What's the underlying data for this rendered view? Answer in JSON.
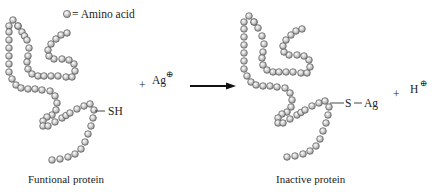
{
  "legend": {
    "symbol_label": "= Amino acid"
  },
  "reactants": {
    "protein_label": "Funtional protein",
    "thiol_group": "SH",
    "plus": "+",
    "ion": "Ag",
    "ion_charge": "⊕"
  },
  "arrow": {
    "direction": "right"
  },
  "products": {
    "protein_label": "Inactive protein",
    "bond_group_s": "S",
    "bond_group_ag": "Ag",
    "plus": "+",
    "ion": "H",
    "ion_charge": "⊕"
  },
  "colors": {
    "bead_fill": "#c8c8c8",
    "bead_stroke": "#555555",
    "text": "#222222",
    "arrow": "#111111"
  },
  "chains": {
    "left": [
      [
        18,
        26
      ],
      [
        13,
        20
      ],
      [
        9,
        26
      ],
      [
        9,
        32
      ],
      [
        9,
        40
      ],
      [
        9,
        48
      ],
      [
        9,
        56
      ],
      [
        9,
        64
      ],
      [
        9,
        72
      ],
      [
        12,
        79
      ],
      [
        16,
        85
      ],
      [
        21,
        88
      ],
      [
        28,
        89
      ],
      [
        35,
        89
      ],
      [
        42,
        90
      ],
      [
        50,
        91
      ],
      [
        55,
        96
      ],
      [
        57,
        103
      ],
      [
        56,
        110
      ],
      [
        52,
        115
      ],
      [
        47,
        117
      ],
      [
        43,
        121
      ],
      [
        43,
        126
      ],
      [
        48,
        126
      ],
      [
        55,
        122
      ],
      [
        62,
        118
      ],
      [
        70,
        113
      ],
      [
        77,
        109
      ],
      [
        84,
        106
      ],
      [
        90,
        104
      ],
      [
        94,
        110
      ],
      [
        93,
        118
      ],
      [
        91,
        126
      ],
      [
        88,
        134
      ],
      [
        85,
        142
      ],
      [
        81,
        149
      ],
      [
        75,
        154
      ],
      [
        68,
        157
      ],
      [
        60,
        159
      ],
      [
        52,
        160
      ]
    ],
    "left_inner": [
      [
        18,
        26
      ],
      [
        22,
        32
      ],
      [
        27,
        40
      ],
      [
        29,
        48
      ],
      [
        28,
        56
      ],
      [
        27,
        62
      ],
      [
        28,
        69
      ],
      [
        32,
        74
      ],
      [
        38,
        76
      ],
      [
        44,
        76
      ],
      [
        51,
        76
      ],
      [
        58,
        76
      ],
      [
        66,
        77
      ],
      [
        72,
        77
      ],
      [
        75,
        71
      ],
      [
        74,
        64
      ],
      [
        69,
        60
      ],
      [
        62,
        59
      ],
      [
        54,
        59
      ],
      [
        49,
        56
      ],
      [
        48,
        50
      ],
      [
        51,
        44
      ],
      [
        56,
        39
      ],
      [
        61,
        35
      ],
      [
        67,
        33
      ]
    ],
    "right": [
      [
        254,
        22
      ],
      [
        249,
        16
      ],
      [
        244,
        22
      ],
      [
        244,
        29
      ],
      [
        244,
        37
      ],
      [
        244,
        45
      ],
      [
        244,
        53
      ],
      [
        244,
        61
      ],
      [
        244,
        69
      ],
      [
        247,
        76
      ],
      [
        251,
        82
      ],
      [
        256,
        85
      ],
      [
        263,
        86
      ],
      [
        270,
        86
      ],
      [
        277,
        87
      ],
      [
        285,
        88
      ],
      [
        290,
        93
      ],
      [
        292,
        100
      ],
      [
        291,
        107
      ],
      [
        287,
        112
      ],
      [
        282,
        114
      ],
      [
        278,
        118
      ],
      [
        278,
        123
      ],
      [
        283,
        123
      ],
      [
        290,
        119
      ],
      [
        297,
        115
      ],
      [
        305,
        110
      ],
      [
        312,
        106
      ],
      [
        319,
        103
      ],
      [
        325,
        101
      ],
      [
        329,
        107
      ],
      [
        328,
        115
      ],
      [
        326,
        123
      ],
      [
        323,
        131
      ],
      [
        320,
        139
      ],
      [
        316,
        146
      ],
      [
        310,
        151
      ],
      [
        303,
        154
      ],
      [
        295,
        156
      ],
      [
        287,
        157
      ]
    ],
    "right_inner": [
      [
        254,
        22
      ],
      [
        258,
        28
      ],
      [
        262,
        36
      ],
      [
        264,
        44
      ],
      [
        263,
        52
      ],
      [
        262,
        58
      ],
      [
        263,
        65
      ],
      [
        267,
        70
      ],
      [
        273,
        72
      ],
      [
        279,
        72
      ],
      [
        286,
        72
      ],
      [
        293,
        72
      ],
      [
        301,
        73
      ],
      [
        307,
        73
      ],
      [
        310,
        67
      ],
      [
        309,
        60
      ],
      [
        304,
        56
      ],
      [
        297,
        55
      ],
      [
        289,
        55
      ],
      [
        284,
        52
      ],
      [
        283,
        46
      ],
      [
        286,
        40
      ],
      [
        291,
        35
      ],
      [
        296,
        31
      ],
      [
        302,
        29
      ]
    ]
  }
}
